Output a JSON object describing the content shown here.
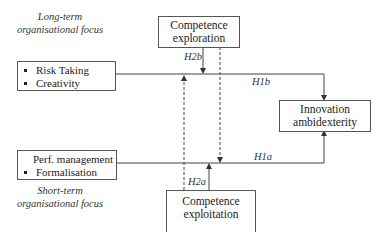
{
  "diagram": {
    "long_term_focus": {
      "line1": "Long-term",
      "line2": "organisational focus"
    },
    "short_term_focus": {
      "line1": "Short-term",
      "line2": "organisational focus"
    },
    "long_term_box": {
      "items": [
        "Risk Taking",
        "Creativity"
      ]
    },
    "short_term_box": {
      "items": [
        "Perf. management",
        "Formalisation"
      ]
    },
    "exploration_box": {
      "line1": "Competence",
      "line2": "exploration"
    },
    "exploitation_box": {
      "line1": "Competence",
      "line2": "exploitation"
    },
    "outcome_box": {
      "line1": "Innovation",
      "line2": "ambidexterity"
    },
    "hypotheses": {
      "h1a": "H1a",
      "h1b": "H1b",
      "h2a": "H2a",
      "h2b": "H2b"
    },
    "colors": {
      "line": "#444444",
      "box_border": "#555555",
      "text": "#222222"
    }
  }
}
